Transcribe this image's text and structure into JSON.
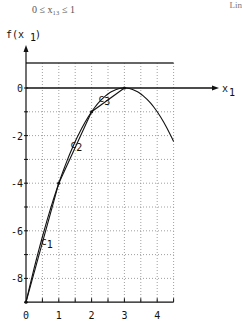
{
  "header": {
    "caption": "0 ≤ x₁₃ ≤ 1",
    "corner_text": "Lin"
  },
  "chart_data": {
    "type": "line",
    "title": "",
    "xlabel": "x₁",
    "ylabel": "f(x₁)",
    "xlim": [
      0,
      4.5
    ],
    "ylim": [
      -9,
      1
    ],
    "grid": true,
    "x_ticks": [
      0,
      1,
      2,
      3,
      4
    ],
    "x_tick_labels": [
      "0",
      "1",
      "2",
      "3",
      "4"
    ],
    "y_ticks": [
      0,
      -2,
      -4,
      -6,
      -8
    ],
    "y_tick_labels": [
      "0",
      "-2",
      "-4",
      "-6",
      "-8"
    ],
    "series": [
      {
        "name": "f(x₁)",
        "style": "curve",
        "x": [
          0,
          0.5,
          1,
          1.5,
          2,
          2.5,
          3,
          3.5,
          4,
          4.5
        ],
        "values": [
          -9,
          -6.25,
          -4,
          -2.25,
          -1,
          -0.25,
          0,
          -0.25,
          -1,
          -2.25
        ]
      },
      {
        "name": "c₁",
        "style": "chord",
        "x": [
          0,
          1
        ],
        "values": [
          -9,
          -4
        ]
      },
      {
        "name": "c₂",
        "style": "chord",
        "x": [
          1,
          2
        ],
        "values": [
          -4,
          -1
        ]
      },
      {
        "name": "c₃",
        "style": "chord",
        "x": [
          2,
          3
        ],
        "values": [
          -1,
          0
        ]
      }
    ],
    "annotations": [
      {
        "text": "c₁",
        "x": 0.45,
        "y": -6.6
      },
      {
        "text": "c₂",
        "x": 1.35,
        "y": -2.5
      },
      {
        "text": "c₃",
        "x": 2.2,
        "y": -0.6
      }
    ]
  }
}
